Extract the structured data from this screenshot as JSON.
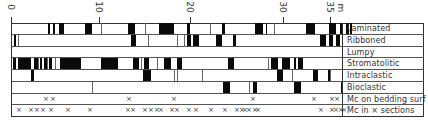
{
  "chart_data": {
    "type": "table",
    "title": "",
    "xlabel": "m",
    "x_axis": {
      "unit": "m",
      "ticks": [
        0,
        10,
        20,
        30,
        35
      ],
      "tick_px": [
        11,
        99,
        190,
        283,
        330
      ],
      "range": [
        0,
        36.5
      ]
    },
    "rows": [
      {
        "label": "Laminated",
        "bars": [
          [
            37,
            2
          ],
          [
            42,
            2
          ],
          [
            48,
            5
          ],
          [
            74,
            7
          ],
          [
            117,
            6
          ],
          [
            123,
            1
          ],
          [
            148,
            15
          ],
          [
            176,
            3
          ],
          [
            211,
            3
          ],
          [
            244,
            8
          ],
          [
            255,
            1
          ],
          [
            295,
            9
          ],
          [
            318,
            7
          ],
          [
            329,
            2
          ],
          [
            335,
            3
          ],
          [
            339,
            2
          ]
        ],
        "dividers": [
          90,
          134,
          199,
          263
        ]
      },
      {
        "label": "Ribboned",
        "bars": [
          [
            3,
            2
          ],
          [
            120,
            5
          ],
          [
            176,
            4
          ],
          [
            182,
            6
          ],
          [
            205,
            6
          ],
          [
            222,
            3
          ],
          [
            309,
            6
          ],
          [
            318,
            4
          ],
          [
            325,
            4
          ]
        ],
        "dividers": [
          4,
          7,
          137,
          166,
          173
        ]
      },
      {
        "label": "Lumpy",
        "bars": [],
        "dividers": []
      },
      {
        "label": "Stromatolitic",
        "bars": [
          [
            2,
            3
          ],
          [
            7,
            13
          ],
          [
            23,
            4
          ],
          [
            29,
            2
          ],
          [
            33,
            3
          ],
          [
            38,
            3
          ],
          [
            49,
            21
          ],
          [
            90,
            17
          ],
          [
            122,
            6
          ],
          [
            133,
            5
          ],
          [
            153,
            7
          ],
          [
            166,
            5
          ],
          [
            217,
            6
          ],
          [
            260,
            4
          ],
          [
            263,
            4
          ],
          [
            271,
            6
          ],
          [
            277,
            2
          ],
          [
            283,
            2
          ],
          [
            287,
            5
          ]
        ],
        "dividers": [
          27,
          36,
          44,
          130,
          146,
          257
        ]
      },
      {
        "label": "Intraclastic",
        "bars": [
          [
            20,
            3
          ],
          [
            132,
            8
          ],
          [
            266,
            6
          ],
          [
            302,
            5
          ],
          [
            317,
            2
          ]
        ],
        "dividers": [
          163,
          166,
          191,
          305,
          281,
          319
        ]
      },
      {
        "label": "Bioclastic",
        "bars": [
          [
            212,
            7
          ],
          [
            242,
            4
          ],
          [
            283,
            7
          ],
          [
            330,
            2
          ]
        ],
        "dividers": [
          81,
          238
        ]
      },
      {
        "label": "Mc on bedding surf",
        "markers_px": [
          32,
          39,
          115,
          160,
          239,
          300,
          318,
          323
        ]
      },
      {
        "label": "Mc in × sections",
        "markers_px": [
          5,
          17,
          23,
          29,
          37,
          54,
          76,
          114,
          119,
          131,
          137,
          143,
          147,
          158,
          163,
          175,
          182,
          197,
          211,
          223,
          228,
          231,
          235,
          241,
          244,
          307,
          318,
          322,
          327,
          330
        ]
      }
    ]
  },
  "axis": {
    "tick_0": "0",
    "tick_10": "10",
    "tick_20": "20",
    "tick_30": "30",
    "tick_35": "35",
    "unit": "m"
  },
  "labels": {
    "r0": "Laminated",
    "r1": "Ribboned",
    "r2": "Lumpy",
    "r3": "Stromatolitic",
    "r4": "Intraclastic",
    "r5": "Bioclastic",
    "r6": "Mc on bedding surf",
    "r7": "Mc in × sections"
  },
  "marker_glyph": "×"
}
